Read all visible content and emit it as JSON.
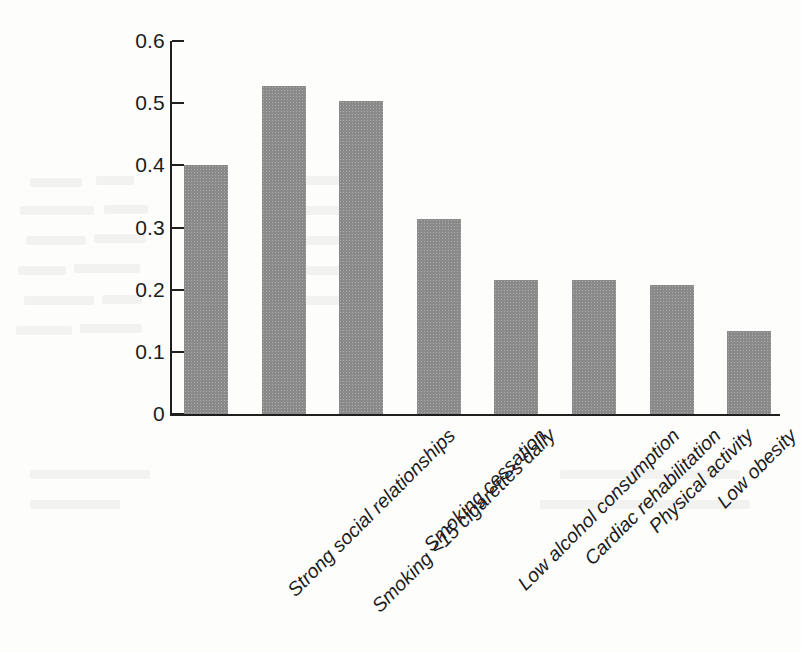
{
  "figure": {
    "background_color": "#fdfdfc",
    "bar_color": "#8a8a8a",
    "axis_color": "#1f1f1f"
  },
  "chart_data": {
    "type": "bar",
    "title": "",
    "subtitle": "",
    "xlabel": "",
    "ylabel": "",
    "ylim": [
      0,
      0.6
    ],
    "ytick_labels": [
      "0",
      "0.1",
      "0.2",
      "0.3",
      "0.4",
      "0.5",
      "0.6"
    ],
    "ytick_values": [
      0,
      0.1,
      0.2,
      0.3,
      0.4,
      0.5,
      0.6
    ],
    "grid": false,
    "legend": false,
    "legend_position": "none",
    "xtick_label_rotation": -45,
    "categories": [
      "Strong social relationships",
      "Smoking <15 cigarettes daily",
      "Smoking cessation",
      "Low alcohol consumption",
      "Cardiac rehabilitation",
      "Physical activity",
      "Low obesity",
      "Hypertension medication"
    ],
    "values": [
      0.4,
      0.527,
      0.503,
      0.314,
      0.215,
      0.216,
      0.207,
      0.133
    ],
    "annotations": []
  }
}
